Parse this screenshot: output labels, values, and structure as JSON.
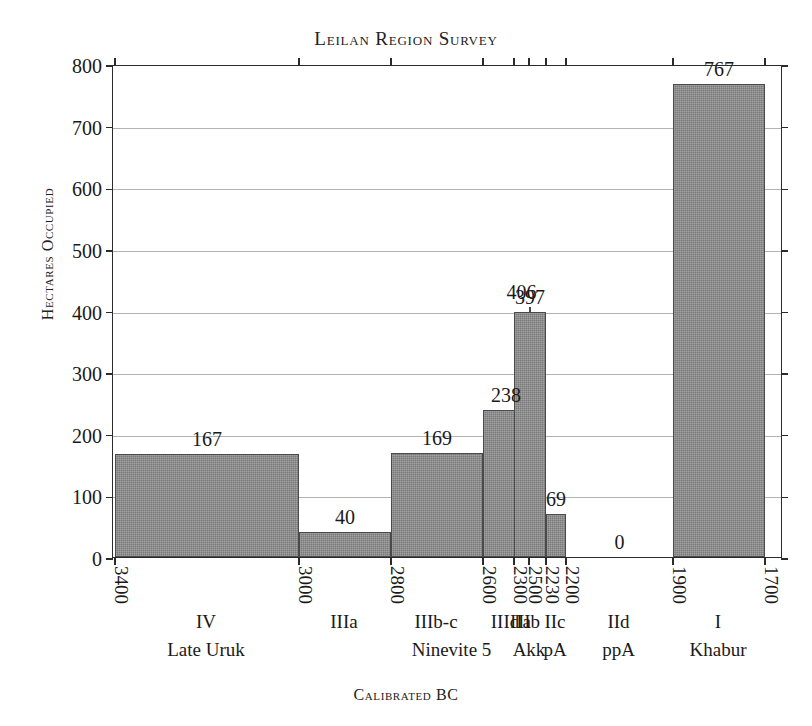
{
  "chart_data": {
    "type": "bar",
    "title": "Leilan Region Survey",
    "xlabel": "Calibrated BC",
    "ylabel": "Hectares Occupied",
    "ylim": [
      0,
      800
    ],
    "ytick_step": 100,
    "yticks": [
      0,
      100,
      200,
      300,
      400,
      500,
      600,
      700,
      800
    ],
    "grid": true,
    "legend": "none",
    "bar_color": "#8a8a8a",
    "axis_color": "#2b2b2b",
    "xtick_labels": [
      "3400",
      "3000",
      "2800",
      "2600",
      "2500",
      "2300",
      "2230",
      "2200",
      "1900",
      "1700"
    ],
    "categories": [
      "IV",
      "IIIa",
      "IIIb-c",
      "IIId",
      "IIa",
      "IIb",
      "IIc",
      "IId",
      "I"
    ],
    "values": [
      167,
      40,
      169,
      238,
      406,
      397,
      69,
      0,
      767
    ],
    "bars": [
      {
        "period": "IV",
        "sub": "Late Uruk",
        "value": 167,
        "value_text": "167",
        "start_bc": 3400,
        "end_bc": 3000
      },
      {
        "period": "IIIa",
        "sub": "",
        "value": 40,
        "value_text": "40",
        "start_bc": 3000,
        "end_bc": 2800
      },
      {
        "period": "IIIb-c",
        "sub": "Ninevite 5",
        "value": 169,
        "value_text": "169",
        "start_bc": 2800,
        "end_bc": 2600
      },
      {
        "period": "IIId",
        "sub": "",
        "value": 238,
        "value_text": "238",
        "start_bc": 2600,
        "end_bc": 2500
      },
      {
        "period": "IIa",
        "sub": "",
        "value": 406,
        "value_text": "406",
        "start_bc": 2500,
        "end_bc": 2300
      },
      {
        "period": "IIb",
        "sub": "Akk",
        "value": 397,
        "value_text": "397",
        "start_bc": 2300,
        "end_bc": 2230
      },
      {
        "period": "IIc",
        "sub": "pA",
        "value": 69,
        "value_text": "69",
        "start_bc": 2230,
        "end_bc": 2200
      },
      {
        "period": "IId",
        "sub": "ppA",
        "value": 0,
        "value_text": "0",
        "start_bc": 2200,
        "end_bc": 1900
      },
      {
        "period": "I",
        "sub": "Khabur",
        "value": 767,
        "value_text": "767",
        "start_bc": 1900,
        "end_bc": 1700
      }
    ],
    "group_label": "Ninevite 5"
  }
}
